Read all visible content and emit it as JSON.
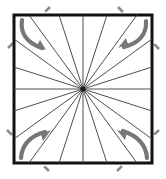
{
  "figure": {
    "canvas": {
      "width": 166,
      "height": 179,
      "background": "#ffffff"
    },
    "frame": {
      "name": "square-border",
      "x": 14,
      "y": 15,
      "width": 138,
      "height": 148,
      "stroke": "#111111",
      "stroke_width": 3,
      "fill": "#ffffff"
    },
    "center": {
      "x": 83,
      "y": 89,
      "dot_radius": 2.6,
      "color": "#1a1a1a"
    },
    "spokes": {
      "name": "radial-lines",
      "count": 20,
      "stroke": "#3a3a3a",
      "stroke_width": 0.9,
      "angles_deg": [
        0,
        18,
        36,
        54,
        72,
        90,
        108,
        126,
        144,
        162,
        180,
        198,
        216,
        234,
        252,
        270,
        288,
        306,
        324,
        342
      ],
      "endpoints": [
        {
          "angle": 0,
          "x": 152,
          "y": 89
        },
        {
          "angle": 18,
          "x": 152,
          "y": 67
        },
        {
          "angle": 36,
          "x": 152,
          "y": 39
        },
        {
          "angle": 54,
          "x": 137,
          "y": 15
        },
        {
          "angle": 72,
          "x": 107,
          "y": 15
        },
        {
          "angle": 90,
          "x": 83,
          "y": 15
        },
        {
          "angle": 108,
          "x": 59,
          "y": 15
        },
        {
          "angle": 126,
          "x": 29,
          "y": 15
        },
        {
          "angle": 144,
          "x": 14,
          "y": 39
        },
        {
          "angle": 162,
          "x": 14,
          "y": 67
        },
        {
          "angle": 180,
          "x": 14,
          "y": 89
        },
        {
          "angle": 198,
          "x": 14,
          "y": 111
        },
        {
          "angle": 216,
          "x": 14,
          "y": 139
        },
        {
          "angle": 234,
          "x": 29,
          "y": 163
        },
        {
          "angle": 252,
          "x": 59,
          "y": 163
        },
        {
          "angle": 270,
          "x": 83,
          "y": 163
        },
        {
          "angle": 288,
          "x": 107,
          "y": 163
        },
        {
          "angle": 306,
          "x": 137,
          "y": 163
        },
        {
          "angle": 324,
          "x": 152,
          "y": 139
        },
        {
          "angle": 342,
          "x": 152,
          "y": 111
        }
      ]
    },
    "dashed_guides": {
      "name": "corner-dashed-diagonals",
      "stroke": "#8a8a8a",
      "stroke_width": 2.6,
      "dash": "7 6",
      "lines": [
        {
          "corner": "top-left",
          "x1": 8,
          "y1": 48,
          "x2": 50,
          "y2": 7
        },
        {
          "corner": "top-right",
          "x1": 118,
          "y1": 7,
          "x2": 159,
          "y2": 49
        },
        {
          "corner": "bottom-left",
          "x1": 7,
          "y1": 130,
          "x2": 49,
          "y2": 171
        },
        {
          "corner": "bottom-right",
          "x1": 117,
          "y1": 171,
          "x2": 159,
          "y2": 130
        }
      ]
    },
    "rotation_arrows": {
      "name": "corner-curved-arrows",
      "stroke": "#777777",
      "stroke_width": 4.2,
      "head_fill": "#777777",
      "items": [
        {
          "corner": "top-left",
          "direction": "down-right",
          "path": "M 22,20 C 20,33 27,43 42,48",
          "head": "46,50 36,47 40,40"
        },
        {
          "corner": "top-right",
          "direction": "down-left",
          "path": "M 146,21 C 147,34 139,43 124,47",
          "head": "118,48 128,44 126,38"
        },
        {
          "corner": "bottom-left",
          "direction": "up-right",
          "path": "M 21,158 C 22,145 30,136 45,132",
          "head": "51,130 41,134 43,141"
        },
        {
          "corner": "bottom-right",
          "direction": "up-left",
          "path": "M 147,158 C 146,145 138,136 123,131",
          "head": "117,130 127,133 125,140"
        }
      ]
    }
  }
}
